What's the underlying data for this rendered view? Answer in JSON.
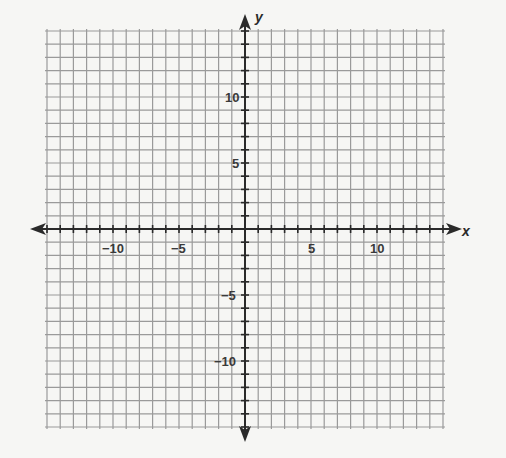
{
  "chart_data": {
    "type": "coordinate-grid",
    "title": "",
    "xlabel": "x",
    "ylabel": "y",
    "xlim": [
      -15,
      15
    ],
    "ylim": [
      -15,
      15
    ],
    "grid": true,
    "grid_step": 1,
    "x_tick_labels": [
      {
        "value": -10,
        "text": "−10"
      },
      {
        "value": -5,
        "text": "−5"
      },
      {
        "value": 5,
        "text": "5"
      },
      {
        "value": 10,
        "text": "10"
      }
    ],
    "y_tick_labels": [
      {
        "value": 10,
        "text": "10"
      },
      {
        "value": 5,
        "text": "5"
      },
      {
        "value": -5,
        "text": "−5"
      },
      {
        "value": -10,
        "text": "−10"
      }
    ]
  },
  "axes": {
    "x_name": "x",
    "y_name": "y",
    "x_ticks": [
      "−10",
      "−5",
      "5",
      "10"
    ],
    "y_ticks": [
      "10",
      "5",
      "−5",
      "−10"
    ]
  },
  "colors": {
    "grid": "#9a9a9a",
    "axis": "#2a2a2a",
    "background": "#f6f6f4"
  }
}
